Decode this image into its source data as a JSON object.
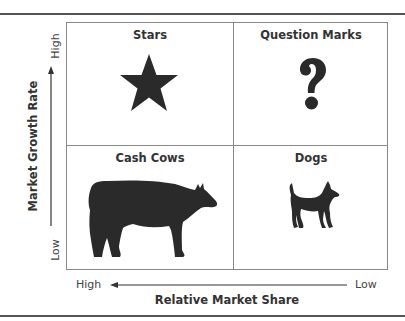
{
  "diagram": {
    "type": "BCG growth-share matrix",
    "quadrants": [
      {
        "id": "stars",
        "label": "Stars",
        "icon": "star-icon",
        "growth": "High",
        "share": "High"
      },
      {
        "id": "question-marks",
        "label": "Question Marks",
        "icon": "question-mark-icon",
        "growth": "High",
        "share": "Low"
      },
      {
        "id": "cash-cows",
        "label": "Cash Cows",
        "icon": "cow-icon",
        "growth": "Low",
        "share": "High"
      },
      {
        "id": "dogs",
        "label": "Dogs",
        "icon": "dog-icon",
        "growth": "Low",
        "share": "Low"
      }
    ],
    "y_axis": {
      "label": "Market Growth Rate",
      "high": "High",
      "low": "Low",
      "direction": "up"
    },
    "x_axis": {
      "label": "Relative Market Share",
      "high": "High",
      "low": "Low",
      "direction": "left"
    },
    "colors": {
      "ink": "#2a2a2a",
      "border": "#888888",
      "background": "#ffffff"
    }
  }
}
